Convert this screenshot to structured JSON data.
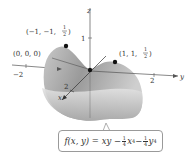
{
  "figure": {
    "function": {
      "lhs": "f(x, y) = xy − ",
      "frac1_num": "1",
      "frac1_den": "4",
      "term1": "x",
      "exp1": "4",
      "minus": " − ",
      "frac2_num": "1",
      "frac2_den": "4",
      "term2": "y",
      "exp2": "4"
    },
    "axes": {
      "z_label": "z",
      "y_label": "y",
      "x_label": "x",
      "z_tick": "1",
      "y_neg_tick": "−2",
      "y_pos_tick": "2",
      "x_tick": "2"
    },
    "points": [
      {
        "label_prefix": "(−1, −1, ",
        "frac_num": "1",
        "frac_den": "2",
        "label_suffix": ")",
        "x": -1,
        "y": -1,
        "z": 0.5
      },
      {
        "label": "(0, 0, 0)",
        "x": 0,
        "y": 0,
        "z": 0
      },
      {
        "label_prefix": "(1, 1, ",
        "frac_num": "1",
        "frac_den": "2",
        "label_suffix": ")",
        "x": 1,
        "y": 1,
        "z": 0.5
      }
    ],
    "colors": {
      "surface_light": "#d4d4d4",
      "surface_dark": "#8c8c8c",
      "axis": "#555555",
      "point": "#111111"
    }
  }
}
